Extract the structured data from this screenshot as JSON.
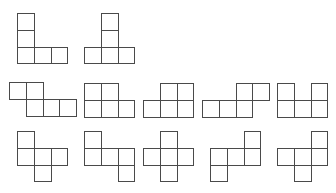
{
  "diagram": {
    "cell_size": 16.8,
    "stroke_color": "#4a4a4a",
    "background": "#ffffff",
    "shapes": [
      {
        "id": "r1s1",
        "row": 1,
        "x": 17,
        "y": 13,
        "cells": [
          [
            0,
            0
          ],
          [
            0,
            1
          ],
          [
            0,
            2
          ],
          [
            1,
            2
          ],
          [
            2,
            2
          ]
        ]
      },
      {
        "id": "r1s2",
        "row": 1,
        "x": 84,
        "y": 13,
        "cells": [
          [
            1,
            0
          ],
          [
            1,
            1
          ],
          [
            0,
            2
          ],
          [
            1,
            2
          ],
          [
            2,
            2
          ]
        ]
      },
      {
        "id": "r2s1",
        "row": 2,
        "x": 9,
        "y": 82,
        "cells": [
          [
            0,
            0
          ],
          [
            1,
            0
          ],
          [
            1,
            1
          ],
          [
            2,
            1
          ],
          [
            3,
            1
          ]
        ]
      },
      {
        "id": "r2s2",
        "row": 2,
        "x": 84,
        "y": 83,
        "cells": [
          [
            0,
            0
          ],
          [
            1,
            0
          ],
          [
            0,
            1
          ],
          [
            1,
            1
          ],
          [
            2,
            1
          ]
        ]
      },
      {
        "id": "r2s3",
        "row": 2,
        "x": 143,
        "y": 83,
        "cells": [
          [
            1,
            0
          ],
          [
            2,
            0
          ],
          [
            0,
            1
          ],
          [
            1,
            1
          ],
          [
            2,
            1
          ]
        ]
      },
      {
        "id": "r2s4",
        "row": 2,
        "x": 202,
        "y": 83,
        "cells": [
          [
            2,
            0
          ],
          [
            3,
            0
          ],
          [
            0,
            1
          ],
          [
            1,
            1
          ],
          [
            2,
            1
          ]
        ]
      },
      {
        "id": "r2s5",
        "row": 2,
        "x": 277,
        "y": 83,
        "cells": [
          [
            0,
            0
          ],
          [
            2,
            0
          ],
          [
            0,
            1
          ],
          [
            1,
            1
          ],
          [
            2,
            1
          ]
        ]
      },
      {
        "id": "r3s1",
        "row": 3,
        "x": 17,
        "y": 131,
        "cells": [
          [
            0,
            0
          ],
          [
            0,
            1
          ],
          [
            1,
            1
          ],
          [
            2,
            1
          ],
          [
            1,
            2
          ]
        ]
      },
      {
        "id": "r3s2",
        "row": 3,
        "x": 84,
        "y": 131,
        "cells": [
          [
            0,
            0
          ],
          [
            0,
            1
          ],
          [
            1,
            1
          ],
          [
            2,
            1
          ],
          [
            2,
            2
          ]
        ]
      },
      {
        "id": "r3s3",
        "row": 3,
        "x": 143,
        "y": 131,
        "cells": [
          [
            1,
            0
          ],
          [
            0,
            1
          ],
          [
            1,
            1
          ],
          [
            2,
            1
          ],
          [
            1,
            2
          ]
        ]
      },
      {
        "id": "r3s4",
        "row": 3,
        "x": 210,
        "y": 131,
        "cells": [
          [
            2,
            0
          ],
          [
            0,
            1
          ],
          [
            1,
            1
          ],
          [
            2,
            1
          ],
          [
            0,
            2
          ]
        ]
      },
      {
        "id": "r3s5",
        "row": 3,
        "x": 277,
        "y": 131,
        "cells": [
          [
            2,
            0
          ],
          [
            0,
            1
          ],
          [
            1,
            1
          ],
          [
            2,
            1
          ],
          [
            1,
            2
          ]
        ]
      }
    ]
  }
}
